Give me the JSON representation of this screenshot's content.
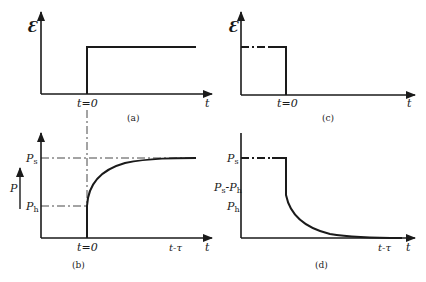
{
  "panels": {
    "a": {
      "caption": "(a)",
      "y_label": "Ɛ",
      "x_label": "t",
      "t0_label": "t=0"
    },
    "b": {
      "caption": "(b)",
      "y_label": "P",
      "x_label": "t",
      "t0_label": "t=0",
      "t_tau_label": "t-τ",
      "ps_label": "P",
      "ps_sub": "s",
      "ph_label": "P",
      "ph_sub": "h"
    },
    "c": {
      "caption": "(c)",
      "y_label": "Ɛ",
      "x_label": "t",
      "t0_label": "t=0"
    },
    "d": {
      "caption": "(d)",
      "x_label": "t",
      "t_tau_label": "t-τ",
      "ps_label": "P",
      "ps_sub": "s",
      "psph_label": "P",
      "psph_sub1": "s",
      "psph_mid": "-P",
      "psph_sub2": "h",
      "ph_label": "P",
      "ph_sub": "h"
    }
  },
  "colors": {
    "ink": "#1a1a1a",
    "background": "#ffffff"
  }
}
